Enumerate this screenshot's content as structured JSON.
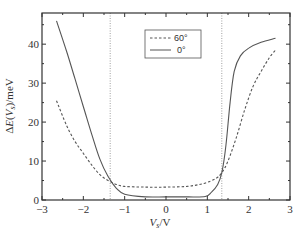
{
  "chart_data": {
    "type": "line",
    "title": "",
    "xlabel": "V_s/V",
    "ylabel": "ΔE(V_s)/meV",
    "xlim": [
      -3,
      3
    ],
    "ylim": [
      0,
      48
    ],
    "xticks": [
      -3,
      -2,
      -1,
      0,
      1,
      2,
      3
    ],
    "xtick_labels": [
      "−3",
      "−2",
      "−1",
      "0",
      "1",
      "2",
      "3"
    ],
    "yticks": [
      0,
      10,
      20,
      30,
      40
    ],
    "ytick_labels": [
      "0",
      "10",
      "20",
      "30",
      "40"
    ],
    "grid": false,
    "legend_position": "upper center",
    "vertical_reference_lines": [
      -1.35,
      1.35
    ],
    "series": [
      {
        "name": "60°",
        "style": "dashed",
        "x": [
          -2.65,
          -2.4,
          -2.2,
          -2.0,
          -1.8,
          -1.6,
          -1.4,
          -1.2,
          -1.0,
          -0.5,
          0.0,
          0.5,
          0.9,
          1.2,
          1.35,
          1.5,
          1.7,
          1.9,
          2.1,
          2.3,
          2.5,
          2.65
        ],
        "values": [
          25.5,
          19,
          15,
          12,
          9,
          6.5,
          5,
          4,
          3.5,
          3.3,
          3.3,
          3.5,
          4.2,
          5.5,
          7,
          10,
          16,
          23,
          29,
          33,
          36.5,
          38.5
        ]
      },
      {
        "name": "0°",
        "style": "solid",
        "x": [
          -2.65,
          -2.4,
          -2.2,
          -2.0,
          -1.8,
          -1.6,
          -1.4,
          -1.2,
          -1.0,
          -0.5,
          0.0,
          0.5,
          0.95,
          1.1,
          1.25,
          1.35,
          1.45,
          1.55,
          1.65,
          1.8,
          2.0,
          2.3,
          2.65
        ],
        "values": [
          46,
          38,
          31,
          24,
          17,
          10.5,
          6,
          3,
          1.5,
          0.8,
          0.8,
          0.8,
          0.9,
          2,
          4,
          7,
          14,
          25,
          33,
          37,
          39,
          40.5,
          41.5
        ]
      }
    ]
  },
  "legend": {
    "items": [
      {
        "label": "60°",
        "style": "dashed"
      },
      {
        "label": "0°",
        "style": "solid"
      }
    ]
  },
  "axes": {
    "xlabel": "V_s/V",
    "ylabel": "ΔE(V_s)/meV"
  },
  "colors": {
    "line": "#555555",
    "axis": "#333333",
    "ref_line": "#888888"
  }
}
